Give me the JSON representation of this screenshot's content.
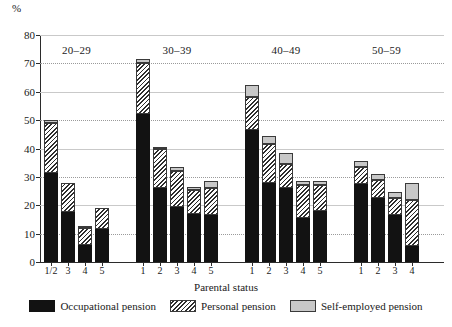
{
  "chart_data": {
    "type": "bar",
    "subtype": "stacked-bar-grouped",
    "title": "",
    "xlabel": "Parental status",
    "ylabel": "%",
    "ylim": [
      0,
      80
    ],
    "yticks": [
      0,
      10,
      20,
      30,
      40,
      50,
      60,
      70,
      80
    ],
    "grid": true,
    "grid_axis": "y",
    "legend_position": "bottom",
    "series": [
      {
        "name": "Occupational pension",
        "key": "occupational",
        "fill": "solid-black",
        "color": "#121212"
      },
      {
        "name": "Personal pension",
        "key": "personal",
        "fill": "diagonal-hatch",
        "color": "#2e2e2e"
      },
      {
        "name": "Self-employed pension",
        "key": "self_employed",
        "fill": "solid-light-grey",
        "color": "#c8c8c8"
      }
    ],
    "groups": [
      {
        "label": "20–29",
        "bars": [
          {
            "category": "1/2",
            "occupational": 31.5,
            "personal": 17.5,
            "self_employed": 1.0,
            "total": 50.0
          },
          {
            "category": "3",
            "occupational": 17.5,
            "personal": 10.5,
            "self_employed": 0.0,
            "total": 28.0
          },
          {
            "category": "4",
            "occupational": 6.0,
            "personal": 6.0,
            "self_employed": 0.5,
            "total": 12.5
          },
          {
            "category": "5",
            "occupational": 11.5,
            "personal": 7.5,
            "self_employed": 0.0,
            "total": 19.0
          }
        ]
      },
      {
        "label": "30–39",
        "bars": [
          {
            "category": "1",
            "occupational": 52.0,
            "personal": 18.0,
            "self_employed": 1.5,
            "total": 71.5
          },
          {
            "category": "2",
            "occupational": 26.0,
            "personal": 14.0,
            "self_employed": 0.5,
            "total": 40.5
          },
          {
            "category": "3",
            "occupational": 19.5,
            "personal": 12.5,
            "self_employed": 1.5,
            "total": 33.5
          },
          {
            "category": "4",
            "occupational": 17.0,
            "personal": 8.5,
            "self_employed": 1.0,
            "total": 26.5
          },
          {
            "category": "5",
            "occupational": 16.5,
            "personal": 9.5,
            "self_employed": 2.5,
            "total": 28.5
          }
        ]
      },
      {
        "label": "40–49",
        "bars": [
          {
            "category": "1",
            "occupational": 46.5,
            "personal": 11.5,
            "self_employed": 4.5,
            "total": 62.5
          },
          {
            "category": "2",
            "occupational": 28.0,
            "personal": 13.5,
            "self_employed": 3.0,
            "total": 44.5
          },
          {
            "category": "3",
            "occupational": 26.0,
            "personal": 8.5,
            "self_employed": 4.0,
            "total": 38.5
          },
          {
            "category": "4",
            "occupational": 15.5,
            "personal": 11.5,
            "self_employed": 1.5,
            "total": 28.5
          },
          {
            "category": "5",
            "occupational": 18.0,
            "personal": 9.0,
            "self_employed": 1.5,
            "total": 28.5
          }
        ]
      },
      {
        "label": "50–59",
        "bars": [
          {
            "category": "1",
            "occupational": 27.5,
            "personal": 6.0,
            "self_employed": 2.0,
            "total": 35.5
          },
          {
            "category": "2",
            "occupational": 22.5,
            "personal": 6.5,
            "self_employed": 2.0,
            "total": 31.0
          },
          {
            "category": "3",
            "occupational": 16.5,
            "personal": 6.0,
            "self_employed": 2.0,
            "total": 24.5
          },
          {
            "category": "4",
            "occupational": 5.5,
            "personal": 16.5,
            "self_employed": 6.0,
            "total": 28.0
          }
        ]
      }
    ]
  }
}
